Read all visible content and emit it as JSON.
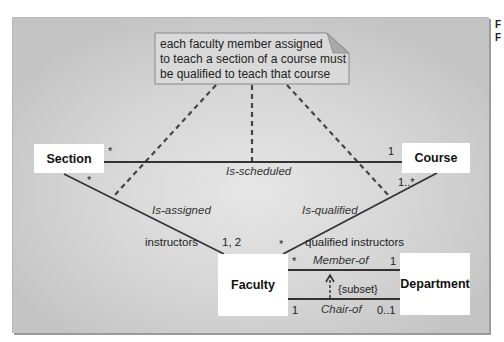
{
  "side_letters": [
    "F",
    "F"
  ],
  "note": {
    "lines": [
      "each faculty member assigned",
      "to teach a section of a course must",
      "be qualified to teach that course"
    ]
  },
  "classes": {
    "section": "Section",
    "course": "Course",
    "faculty": "Faculty",
    "department": "Department"
  },
  "associations": {
    "is_scheduled": {
      "name": "Is-scheduled",
      "section_mult": "*",
      "course_mult": "1"
    },
    "is_assigned": {
      "name": "Is-assigned",
      "section_mult": "*",
      "role": "instructors",
      "faculty_mult": "1, 2"
    },
    "is_qualified": {
      "name": "Is-qualified",
      "course_mult": "1..*",
      "role": "qualified instructors",
      "faculty_mult": "*"
    },
    "member_of": {
      "name": "Member-of",
      "faculty_mult": "*",
      "department_mult": "1"
    },
    "chair_of": {
      "name": "Chair-of",
      "faculty_mult": "1",
      "department_mult": "0..1"
    },
    "constraint": "{subset}"
  },
  "colors": {
    "line": "#333333",
    "dashed": "#444444",
    "class_fill": "#ffffff",
    "note_fill": "#d9d9d9",
    "panel_edge": "#c4c4c4",
    "panel_center": "#e6e6e6"
  }
}
